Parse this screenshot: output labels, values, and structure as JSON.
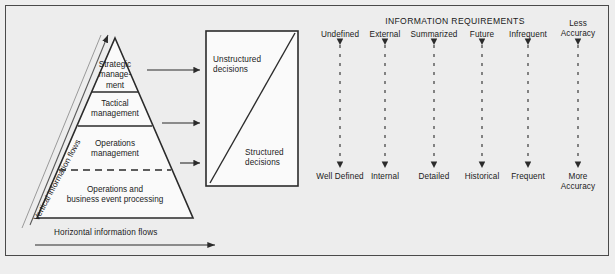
{
  "figure": {
    "background_color": "#ededed",
    "frame_color": "#4a4a4a",
    "line_color": "#2b2b2b"
  },
  "pyramid": {
    "levels": [
      {
        "id": "strategic",
        "label_line1": "Strategic",
        "label_line2": "manage-",
        "label_line3": "ment"
      },
      {
        "id": "tactical",
        "label_line1": "Tactical",
        "label_line2": "management"
      },
      {
        "id": "operations-management",
        "label_line1": "Operations",
        "label_line2": "management"
      },
      {
        "id": "operations-business-event",
        "label_line1": "Operations and",
        "label_line2": "business event processing"
      }
    ],
    "vertical_flow_label": "Vertical information flows",
    "horizontal_flow_label": "Horizontal information flows"
  },
  "decision_box": {
    "top_label_line1": "Unstructured",
    "top_label_line2": "decisions",
    "bottom_label_line1": "Structured",
    "bottom_label_line2": "decisions"
  },
  "information_requirements": {
    "title": "INFORMATION REQUIREMENTS",
    "columns": [
      {
        "top": "Undefined",
        "bottom": "Well Defined"
      },
      {
        "top": "External",
        "bottom": "Internal"
      },
      {
        "top": "Summarized",
        "bottom": "Detailed"
      },
      {
        "top": "Future",
        "bottom": "Historical"
      },
      {
        "top": "Infrequent",
        "bottom": "Frequent"
      },
      {
        "top": "Less Accuracy",
        "top_line1": "Less",
        "top_line2": "Accuracy",
        "bottom": "More Accuracy",
        "bottom_line1": "More",
        "bottom_line2": "Accuracy"
      }
    ]
  }
}
